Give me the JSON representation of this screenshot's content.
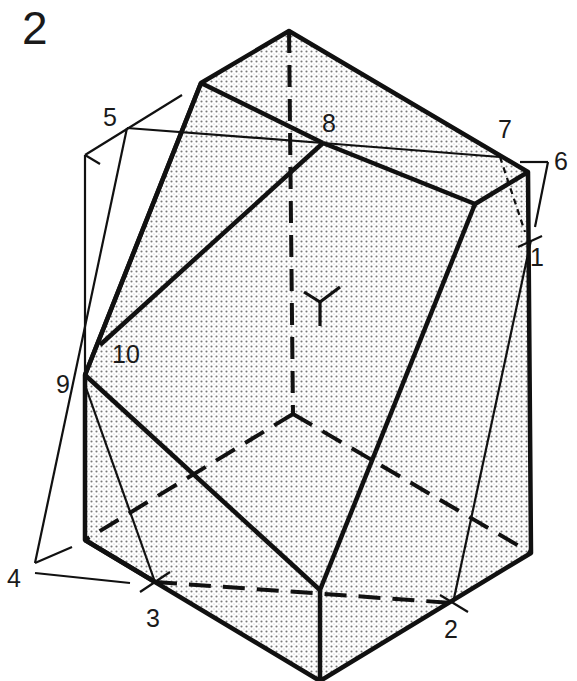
{
  "figure": {
    "number": "2",
    "axis_symbol": "Y",
    "colors": {
      "ink": "#111111",
      "fill": "#e4e4e4",
      "dot": "#7a7a7a",
      "background": "#ffffff"
    }
  },
  "labels": [
    {
      "id": "1",
      "text": "1",
      "x": 530,
      "y": 266
    },
    {
      "id": "2",
      "text": "2",
      "x": 444,
      "y": 638
    },
    {
      "id": "3",
      "text": "3",
      "x": 146,
      "y": 627
    },
    {
      "id": "4",
      "text": "4",
      "x": 7,
      "y": 587
    },
    {
      "id": "5",
      "text": "5",
      "x": 103,
      "y": 126
    },
    {
      "id": "6",
      "text": "6",
      "x": 554,
      "y": 170
    },
    {
      "id": "7",
      "text": "7",
      "x": 498,
      "y": 138
    },
    {
      "id": "8",
      "text": "8",
      "x": 322,
      "y": 132
    },
    {
      "id": "9",
      "text": "9",
      "x": 56,
      "y": 393
    },
    {
      "id": "10",
      "text": "10",
      "x": 112,
      "y": 363
    }
  ]
}
